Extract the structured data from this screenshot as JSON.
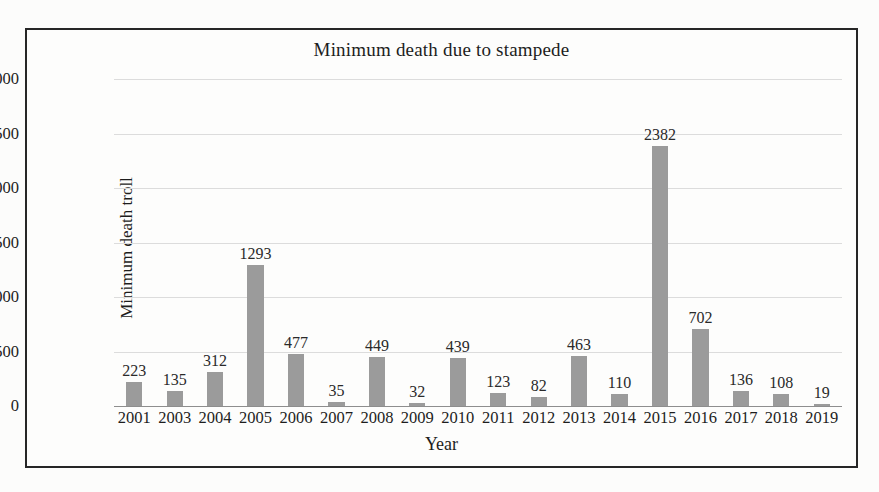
{
  "chart_data": {
    "type": "bar",
    "title": "Minimum death due to stampede",
    "xlabel": "Year",
    "ylabel": "Minimum death troll",
    "categories": [
      "2001",
      "2003",
      "2004",
      "2005",
      "2006",
      "2007",
      "2008",
      "2009",
      "2010",
      "2011",
      "2012",
      "2013",
      "2014",
      "2015",
      "2016",
      "2017",
      "2018",
      "2019"
    ],
    "values": [
      223,
      135,
      312,
      1293,
      477,
      35,
      449,
      32,
      439,
      123,
      82,
      463,
      110,
      2382,
      702,
      136,
      108,
      19
    ],
    "ylim": [
      0,
      3000
    ],
    "ytick_values": [
      0,
      500,
      1000,
      1500,
      2000,
      2500,
      3000
    ],
    "ytick_labels": [
      "0",
      "500",
      "1,000",
      "1,500",
      "2,000",
      "2,500",
      "3,000"
    ],
    "grid": true,
    "legend": "none",
    "data_labels": true,
    "series": [
      {
        "name": "Minimum death troll",
        "values": [
          223,
          135,
          312,
          1293,
          477,
          35,
          449,
          32,
          439,
          123,
          82,
          463,
          110,
          2382,
          702,
          136,
          108,
          19
        ]
      }
    ]
  },
  "colors": {
    "bar_fill": "#9b9b9b",
    "gridline": "#dcdcdc",
    "axis_line": "#8e8e8e",
    "frame_border": "#262626",
    "text": "#1d1d1d",
    "page_background": "#fcfcfb"
  }
}
